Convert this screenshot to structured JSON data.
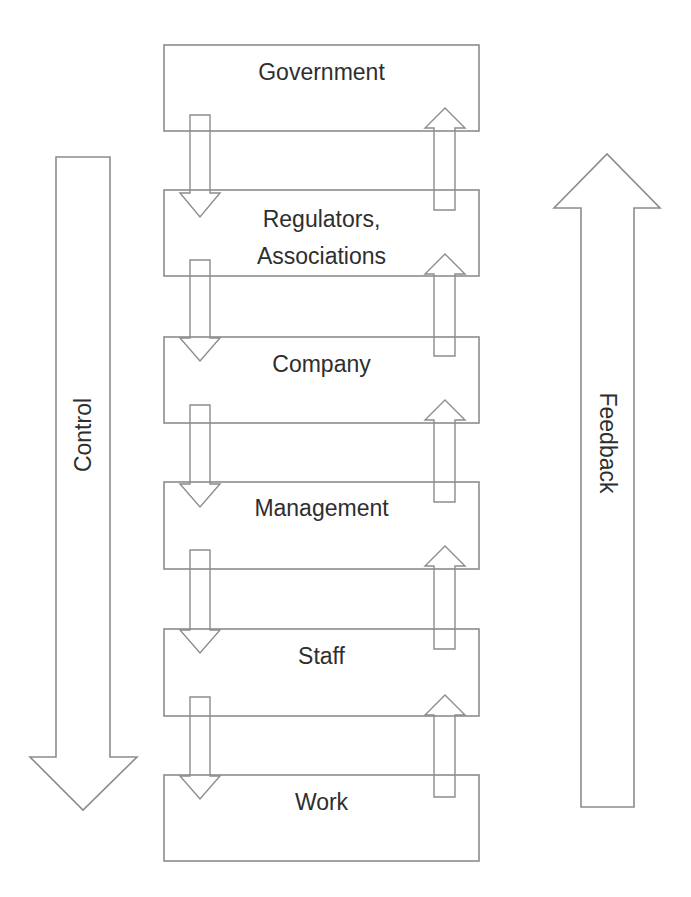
{
  "diagram": {
    "type": "hierarchy-flow",
    "levels": [
      {
        "label": "Government"
      },
      {
        "label": "Regulators,\nAssociations"
      },
      {
        "label": "Company"
      },
      {
        "label": "Management"
      },
      {
        "label": "Staff"
      },
      {
        "label": "Work"
      }
    ],
    "left_arrow": {
      "label": "Control",
      "direction": "down"
    },
    "right_arrow": {
      "label": "Feedback",
      "direction": "up"
    },
    "colors": {
      "stroke": "#8c8c8c",
      "text": "#2e2e2e",
      "background": "#ffffff"
    }
  }
}
